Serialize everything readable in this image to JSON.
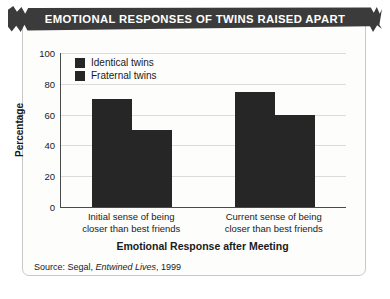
{
  "banner": {
    "title": "EMOTIONAL RESPONSES OF TWINS RAISED APART"
  },
  "source": {
    "prefix": "Source: Segal, ",
    "work": "Entwined Lives",
    "suffix": ", 1999"
  },
  "colors": {
    "bar": "#262626",
    "banner": "#3b3b3b",
    "gridline": "#dcdcdc",
    "axis": "#4a4a4a",
    "card_background": "#fdfdfc"
  },
  "chart_data": {
    "type": "bar",
    "title": "EMOTIONAL RESPONSES OF TWINS RAISED APART",
    "xlabel": "Emotional Response after Meeting",
    "ylabel": "Percentage",
    "categories": [
      "Initial sense of being closer than best friends",
      "Current sense of being closer than best friends"
    ],
    "category_lines": [
      [
        "Initial sense of being",
        "closer than best friends"
      ],
      [
        "Current sense of being",
        "closer than best friends"
      ]
    ],
    "series": [
      {
        "name": "Identical twins",
        "values": [
          70,
          75
        ]
      },
      {
        "name": "Fraternal twins",
        "values": [
          50,
          60
        ]
      }
    ],
    "ylim": [
      0,
      100
    ],
    "yticks": [
      0,
      20,
      40,
      60,
      80,
      100
    ],
    "ytick_labels": [
      "0",
      "20",
      "40",
      "60",
      "80",
      "100"
    ],
    "grid": true,
    "legend_position": "top-left",
    "legend": [
      "Identical twins",
      "Fraternal twins"
    ]
  }
}
